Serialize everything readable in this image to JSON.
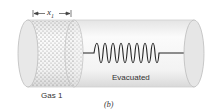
{
  "diagram": {
    "labels": {
      "dimension": "x",
      "dimension_sub": "1",
      "gas": "Gas 1",
      "evacuated": "Evacuated",
      "panel": "(b)"
    },
    "colors": {
      "cylinder_fill": "#f2f2f2",
      "cylinder_edge": "#c8c8c8",
      "cap_fill": "#e6e6e6",
      "gas_dots": "#707070",
      "spring": "#222222"
    }
  }
}
